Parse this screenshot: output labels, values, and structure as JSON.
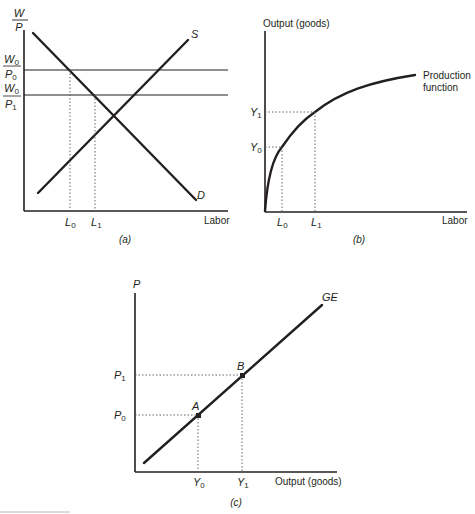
{
  "panels": {
    "a": {
      "caption": "(a)",
      "y_label_num": "W",
      "y_label_den": "P",
      "x_label": "Labor",
      "supply_label": "S",
      "demand_label": "D",
      "wage_levels": [
        {
          "num": "W",
          "num_sub": "0",
          "den": "P",
          "den_sub": "0"
        },
        {
          "num": "W",
          "num_sub": "0",
          "den": "P",
          "den_sub": "1"
        }
      ],
      "x_ticks": [
        {
          "label": "L",
          "sub": "0"
        },
        {
          "label": "L",
          "sub": "1"
        }
      ]
    },
    "b": {
      "caption": "(b)",
      "y_label": "Output (goods)",
      "x_label": "Labor",
      "curve_label_line1": "Production",
      "curve_label_line2": "function",
      "y_ticks": [
        {
          "label": "Y",
          "sub": "1"
        },
        {
          "label": "Y",
          "sub": "0"
        }
      ],
      "x_ticks": [
        {
          "label": "L",
          "sub": "0"
        },
        {
          "label": "L",
          "sub": "1"
        }
      ]
    },
    "c": {
      "caption": "(c)",
      "y_label": "P",
      "x_label": "Output (goods)",
      "curve_label": "GE",
      "points": [
        {
          "label": "A"
        },
        {
          "label": "B"
        }
      ],
      "y_ticks": [
        {
          "label": "P",
          "sub": "1"
        },
        {
          "label": "P",
          "sub": "0"
        }
      ],
      "x_ticks": [
        {
          "label": "Y",
          "sub": "0"
        },
        {
          "label": "Y",
          "sub": "1"
        }
      ]
    }
  },
  "colors": {
    "ink": "#231f20",
    "background": "#ffffff"
  }
}
